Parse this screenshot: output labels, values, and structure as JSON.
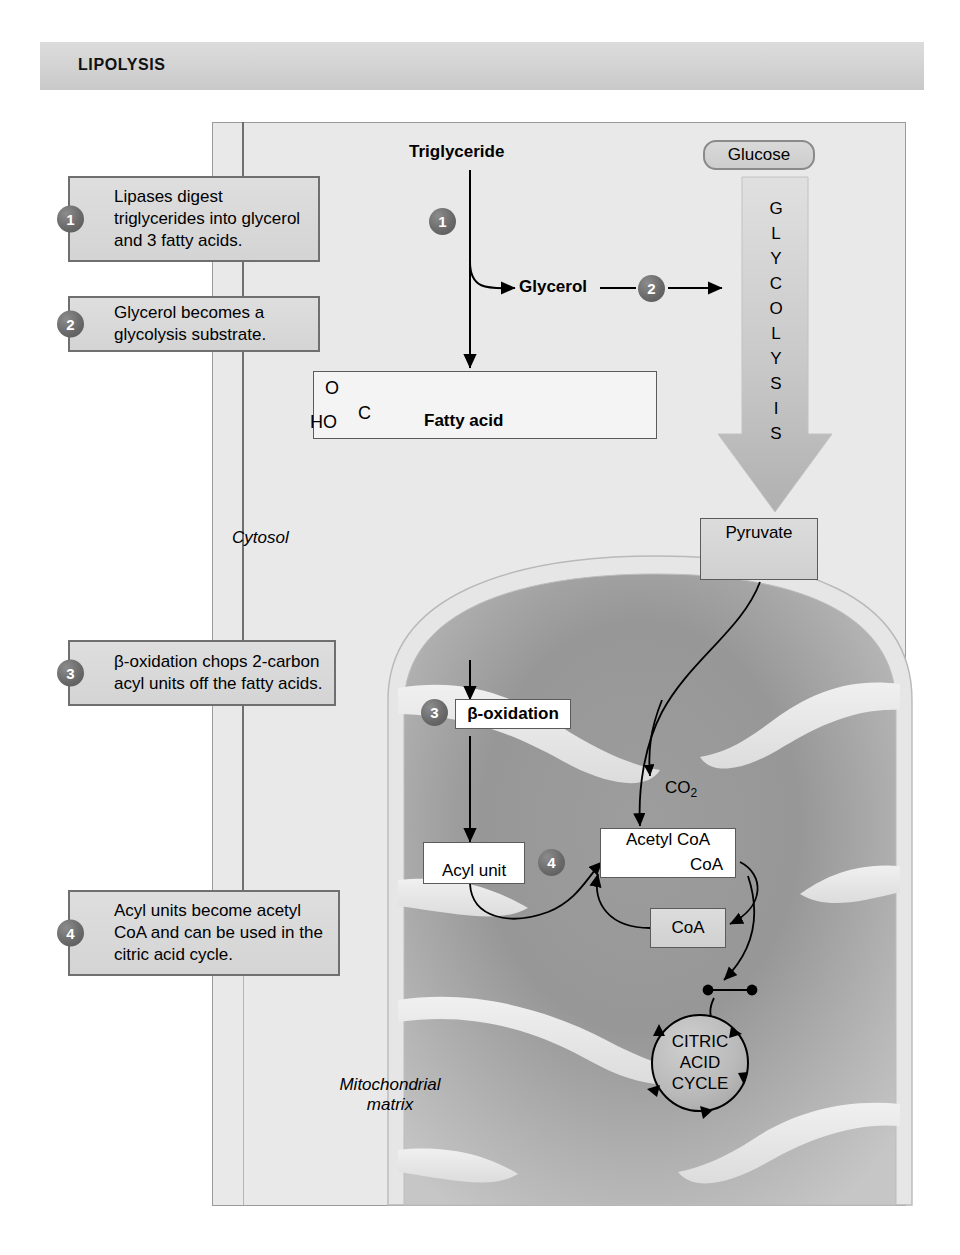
{
  "header": {
    "title": "LIPOLYSIS"
  },
  "callouts": [
    {
      "number": "1",
      "text": "Lipases digest triglycerides into glycerol and 3 fatty acids."
    },
    {
      "number": "2",
      "text": "Glycerol becomes a glycolysis substrate."
    },
    {
      "number": "3",
      "text": "β-oxidation chops 2-carbon acyl units off the fatty acids."
    },
    {
      "number": "4",
      "text": "Acyl units become acetyl CoA and can be used in the citric acid cycle."
    }
  ],
  "nodes": {
    "triglyceride": "Triglyceride",
    "glucose": "Glucose",
    "glycerol": "Glycerol",
    "glycolysis_letters": [
      "G",
      "L",
      "Y",
      "C",
      "O",
      "L",
      "Y",
      "S",
      "I",
      "S"
    ],
    "pyruvate": "Pyruvate",
    "fatty_acid": "Fatty acid",
    "fatty_acid_carbonyl_o": "O",
    "fatty_acid_c": "C",
    "fatty_acid_ho": "HO",
    "beta_oxidation": "β-oxidation",
    "acyl_unit": "Acyl unit",
    "acetyl_coa": "Acetyl CoA",
    "acetyl_coa_formula": "CoA",
    "coa": "CoA",
    "co2": "CO",
    "co2_sub": "2",
    "citric_acid_cycle": [
      "CITRIC",
      "ACID",
      "CYCLE"
    ],
    "cytosol": "Cytosol",
    "mitochondrial_matrix_line1": "Mitochondrial",
    "mitochondrial_matrix_line2": "matrix"
  },
  "inline_step_badges": {
    "step1": "1",
    "step2": "2",
    "step3": "3",
    "step4": "4"
  },
  "colors": {
    "banner": "#d6d6d6",
    "panel_bg": "#e9e9e9",
    "callout_fill": "#d8d8d8",
    "callout_border": "#6f6f6f",
    "badge_fill": "#646464",
    "mito_outer": "#e4e4e4",
    "mito_matrix_dark": "#8f8f8f",
    "arrow": "#000000"
  }
}
